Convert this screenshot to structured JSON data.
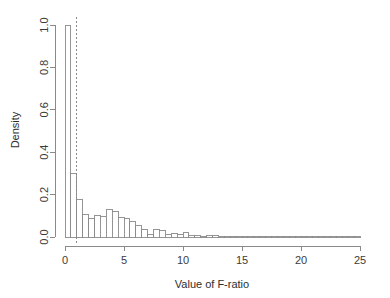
{
  "chart_data": {
    "type": "bar",
    "title": "",
    "subtitle": "",
    "xlabel": "Value of F-ratio",
    "ylabel": "Density",
    "xlim": [
      0,
      25
    ],
    "ylim": [
      0,
      1.0
    ],
    "grid": false,
    "legend": null,
    "xticks": [
      0,
      5,
      10,
      15,
      20,
      25
    ],
    "xtick_labels": [
      "0",
      "5",
      "10",
      "15",
      "20",
      "25"
    ],
    "yticks": [
      0.0,
      0.2,
      0.4,
      0.6,
      0.8,
      1.0
    ],
    "ytick_labels": [
      "0.0",
      "0.2",
      "0.4",
      "0.6",
      "0.8",
      "1.0"
    ],
    "bin_width": 0.5,
    "bin_starts": [
      0.0,
      0.5,
      1.0,
      1.5,
      2.0,
      2.5,
      3.0,
      3.5,
      4.0,
      4.5,
      5.0,
      5.5,
      6.0,
      6.5,
      7.0,
      7.5,
      8.0,
      8.5,
      9.0,
      9.5,
      10.0,
      10.5,
      11.0,
      11.5,
      12.0,
      12.5,
      13.0,
      13.5,
      14.0,
      14.5,
      15.0,
      15.5,
      16.0,
      16.5,
      17.0,
      17.5,
      18.0,
      18.5,
      19.0,
      19.5,
      20.0,
      20.5,
      21.0,
      21.5,
      22.0,
      22.5,
      23.0,
      23.5,
      24.0,
      24.5
    ],
    "categories": [
      "0.0-0.5",
      "0.5-1.0",
      "1.0-1.5",
      "1.5-2.0",
      "2.0-2.5",
      "2.5-3.0",
      "3.0-3.5",
      "3.5-4.0",
      "4.0-4.5",
      "4.5-5.0",
      "5.0-5.5",
      "5.5-6.0",
      "6.0-6.5",
      "6.5-7.0",
      "7.0-7.5",
      "7.5-8.0",
      "8.0-8.5",
      "8.5-9.0",
      "9.0-9.5",
      "9.5-10.0",
      "10.0-10.5",
      "10.5-11.0",
      "11.0-11.5",
      "11.5-12.0",
      "12.0-12.5",
      "12.5-13.0",
      "13.0-13.5",
      "13.5-14.0",
      "14.0-14.5",
      "14.5-15.0",
      "15.0-15.5",
      "15.5-16.0",
      "16.0-16.5",
      "16.5-17.0",
      "17.0-17.5",
      "17.5-18.0",
      "18.0-18.5",
      "18.5-19.0",
      "19.0-19.5",
      "19.5-20.0",
      "20.0-20.5",
      "20.5-21.0",
      "21.0-21.5",
      "21.5-22.0",
      "22.0-22.5",
      "22.5-23.0",
      "23.0-23.5",
      "23.5-24.0",
      "24.0-24.5",
      "24.5-25.0"
    ],
    "values": [
      1.0,
      0.3,
      0.175,
      0.105,
      0.085,
      0.1,
      0.095,
      0.13,
      0.12,
      0.09,
      0.085,
      0.075,
      0.055,
      0.035,
      0.012,
      0.035,
      0.03,
      0.012,
      0.018,
      0.01,
      0.022,
      0.009,
      0.005,
      0.004,
      0.008,
      0.006,
      0.003,
      0.002,
      0.002,
      0.002,
      0.002,
      0.001,
      0.001,
      0.001,
      0.001,
      0.001,
      0.001,
      0.001,
      0.001,
      0.001,
      0.001,
      0.001,
      0.001,
      0.001,
      0.001,
      0.001,
      0.001,
      0.001,
      0.001,
      0.001
    ],
    "annotations": [
      {
        "type": "vertical-line",
        "label": "critical-value-line",
        "x": 1.0,
        "style": "dashed"
      }
    ]
  },
  "colors": {
    "bar_fill": "#ffffff",
    "bar_stroke": "#8a8a8a",
    "axis": "#8a8a8a",
    "text": "#2e2e2e",
    "background": "#ffffff"
  }
}
